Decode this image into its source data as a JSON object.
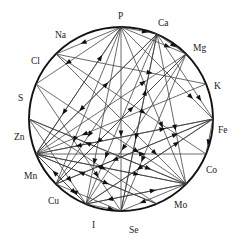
{
  "figure": {
    "kind": "circular-interaction-diagram",
    "title": "",
    "background_color": "#ffffff",
    "ring_color": "#111111",
    "edge_color": "#3a3a3a",
    "arrow_color": "#111111",
    "label_color": "#1a1a1a"
  },
  "chart_data": {
    "type": "diagram",
    "title": "",
    "xlabel": "",
    "ylabel": "",
    "layout": "circular",
    "grid": false,
    "legend": "none",
    "circle": {
      "cx": 121,
      "cy": 119,
      "r": 92
    },
    "nodes": [
      {
        "id": "P",
        "label": "P",
        "angle_deg": -90,
        "x": 121,
        "y": 27,
        "label_x": 118,
        "label_y": 19
      },
      {
        "id": "Ca",
        "label": "Ca",
        "angle_deg": -67,
        "x": 157,
        "y": 34,
        "label_x": 158,
        "label_y": 26
      },
      {
        "id": "Mg",
        "label": "Mg",
        "angle_deg": -45,
        "x": 186,
        "y": 54,
        "label_x": 193,
        "label_y": 51
      },
      {
        "id": "K",
        "label": "K",
        "angle_deg": -22,
        "x": 206,
        "y": 84,
        "label_x": 214,
        "label_y": 89
      },
      {
        "id": "Fe",
        "label": "Fe",
        "angle_deg": 0,
        "x": 213,
        "y": 119,
        "label_x": 218,
        "label_y": 133
      },
      {
        "id": "Co",
        "label": "Co",
        "angle_deg": 22,
        "x": 206,
        "y": 154,
        "label_x": 206,
        "label_y": 173
      },
      {
        "id": "Mo",
        "label": "Mo",
        "angle_deg": 45,
        "x": 186,
        "y": 184,
        "label_x": 174,
        "label_y": 208
      },
      {
        "id": "Se",
        "label": "Se",
        "angle_deg": 67,
        "x": 157,
        "y": 204,
        "label_x": 129,
        "label_y": 233
      },
      {
        "id": "I",
        "label": "I",
        "angle_deg": 90,
        "x": 121,
        "y": 211,
        "label_x": 92,
        "label_y": 228
      },
      {
        "id": "Cu",
        "label": "Cu",
        "angle_deg": 112,
        "x": 86,
        "y": 204,
        "label_x": 48,
        "label_y": 204
      },
      {
        "id": "Mn",
        "label": "Mn",
        "angle_deg": 135,
        "x": 56,
        "y": 184,
        "label_x": 24,
        "label_y": 179
      },
      {
        "id": "Zn",
        "label": "Zn",
        "angle_deg": 158,
        "x": 36,
        "y": 154,
        "label_x": 14,
        "label_y": 140
      },
      {
        "id": "S",
        "label": "S",
        "angle_deg": 180,
        "x": 29,
        "y": 119,
        "label_x": 18,
        "label_y": 101
      },
      {
        "id": "Cl",
        "label": "Cl",
        "angle_deg": 202,
        "x": 36,
        "y": 84,
        "label_x": 31,
        "label_y": 64
      },
      {
        "id": "Na",
        "label": "Na",
        "angle_deg": 225,
        "x": 56,
        "y": 54,
        "label_x": 55,
        "label_y": 38
      },
      {
        "id": "B",
        "label": "",
        "angle_deg": 248,
        "x": 86,
        "y": 34,
        "label_x": 86,
        "label_y": 26
      }
    ],
    "edges": [
      {
        "from": "P",
        "to": "Na",
        "directed": true
      },
      {
        "from": "P",
        "to": "Cl",
        "directed": true
      },
      {
        "from": "P",
        "to": "Zn",
        "directed": true
      },
      {
        "from": "P",
        "to": "Mn",
        "directed": true
      },
      {
        "from": "P",
        "to": "Cu",
        "directed": true
      },
      {
        "from": "P",
        "to": "I",
        "directed": true
      },
      {
        "from": "P",
        "to": "Mo",
        "directed": true
      },
      {
        "from": "P",
        "to": "Ca",
        "directed": true
      },
      {
        "from": "P",
        "to": "Mg",
        "directed": true
      },
      {
        "from": "P",
        "to": "Fe",
        "directed": true
      },
      {
        "from": "Ca",
        "to": "Mg",
        "directed": true
      },
      {
        "from": "Ca",
        "to": "Zn",
        "directed": true
      },
      {
        "from": "Ca",
        "to": "Mn",
        "directed": true
      },
      {
        "from": "Ca",
        "to": "Cu",
        "directed": true
      },
      {
        "from": "Ca",
        "to": "Fe",
        "directed": true
      },
      {
        "from": "Ca",
        "to": "I",
        "directed": true
      },
      {
        "from": "Mg",
        "to": "Cu",
        "directed": true
      },
      {
        "from": "Mg",
        "to": "Mn",
        "directed": true
      },
      {
        "from": "K",
        "to": "Zn",
        "directed": true
      },
      {
        "from": "Fe",
        "to": "Zn",
        "directed": true
      },
      {
        "from": "Fe",
        "to": "Cu",
        "directed": true
      },
      {
        "from": "Fe",
        "to": "Mn",
        "directed": true
      },
      {
        "from": "Fe",
        "to": "Co",
        "directed": true
      },
      {
        "from": "Zn",
        "to": "Fe",
        "directed": true
      },
      {
        "from": "Zn",
        "to": "Cu",
        "directed": true
      },
      {
        "from": "Zn",
        "to": "Ca",
        "directed": true
      },
      {
        "from": "Zn",
        "to": "Co",
        "directed": true
      },
      {
        "from": "Zn",
        "to": "Mo",
        "directed": true
      },
      {
        "from": "Zn",
        "to": "Mg",
        "directed": true
      },
      {
        "from": "Zn",
        "to": "P",
        "directed": true
      },
      {
        "from": "Zn",
        "to": "Se",
        "directed": true
      },
      {
        "from": "Cu",
        "to": "Zn",
        "directed": true
      },
      {
        "from": "Cu",
        "to": "Mo",
        "directed": true
      },
      {
        "from": "Cu",
        "to": "Fe",
        "directed": true
      },
      {
        "from": "Mo",
        "to": "Cu",
        "directed": true
      },
      {
        "from": "Mo",
        "to": "Zn",
        "directed": true
      },
      {
        "from": "Mo",
        "to": "S",
        "directed": true
      },
      {
        "from": "Mo",
        "to": "I",
        "directed": true
      },
      {
        "from": "S",
        "to": "Cu",
        "directed": true
      },
      {
        "from": "S",
        "to": "Mo",
        "directed": true
      },
      {
        "from": "S",
        "to": "Se",
        "directed": true
      },
      {
        "from": "Se",
        "to": "Zn",
        "directed": true
      },
      {
        "from": "I",
        "to": "Ca",
        "directed": true
      },
      {
        "from": "I",
        "to": "Mn",
        "directed": true
      },
      {
        "from": "Mn",
        "to": "Fe",
        "directed": true
      },
      {
        "from": "Mn",
        "to": "Mg",
        "directed": true
      },
      {
        "from": "Na",
        "to": "K",
        "directed": true
      },
      {
        "from": "Cl",
        "to": "Mo",
        "directed": true
      },
      {
        "from": "Cl",
        "to": "I",
        "directed": true
      },
      {
        "from": "Na",
        "to": "Mo",
        "directed": true
      },
      {
        "from": "Na",
        "to": "Co",
        "directed": true
      },
      {
        "from": "Ca",
        "to": "Mo",
        "directed": true
      },
      {
        "from": "Mg",
        "to": "I",
        "directed": true
      },
      {
        "from": "Cu",
        "to": "I",
        "directed": true
      }
    ],
    "node_count": 16,
    "edge_count": 54
  }
}
